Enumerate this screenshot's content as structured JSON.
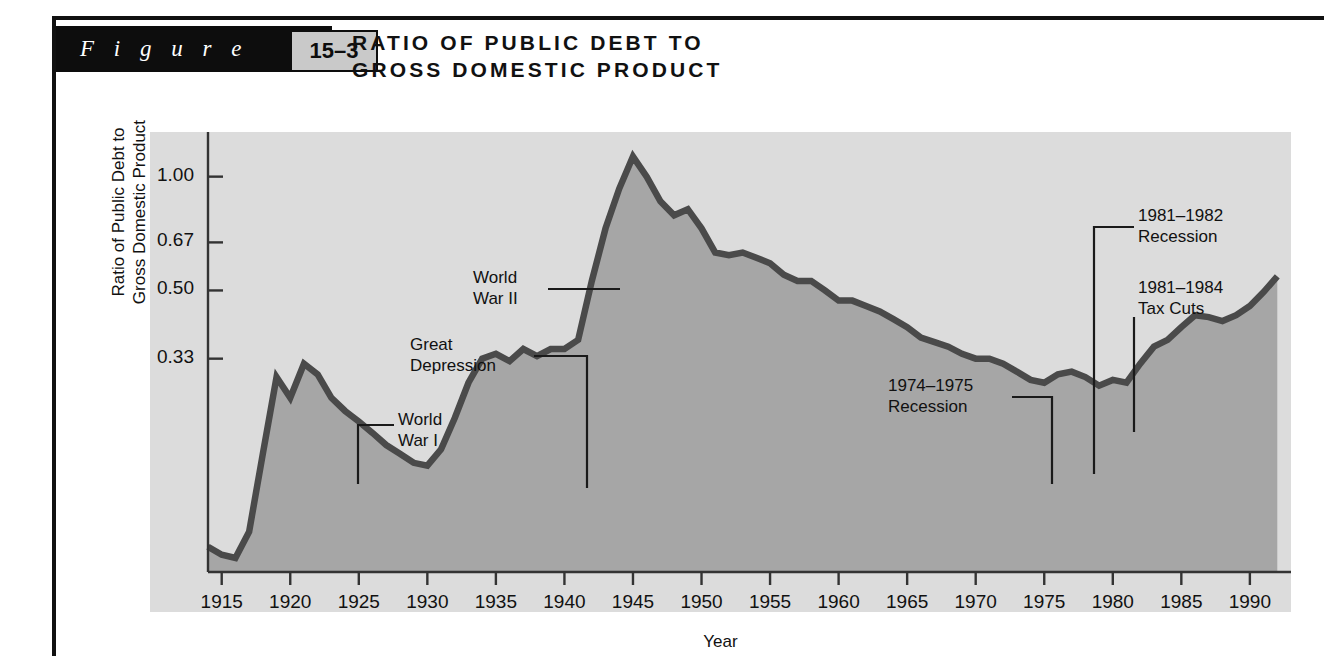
{
  "figure": {
    "label": "F i g u r e",
    "number": "15–3"
  },
  "headline": {
    "line1": "RATIO OF PUBLIC DEBT TO",
    "line2": "GROSS DOMESTIC PRODUCT",
    "full": "RATIO OF PUBLIC DEBT TO\nGROSS DOMESTIC PRODUCT"
  },
  "colors": {
    "panel_background": "#dcdcdc",
    "area_fill": "#a6a6a6",
    "line": "#4a4a4a",
    "axis": "#333333",
    "text": "#111111",
    "figure_block": "#0d0d0d",
    "figure_number_box": "#c9c9c9"
  },
  "chart_data": {
    "type": "area",
    "title": "RATIO OF PUBLIC DEBT TO GROSS DOMESTIC PRODUCT",
    "xlabel": "Year",
    "ylabel": "Ratio of Public Debt to\nGross Domestic Product",
    "yscale": "log",
    "ylim": [
      0.09,
      1.25
    ],
    "xlim": [
      1914,
      1993
    ],
    "grid": false,
    "legend": null,
    "ytick_labels": [
      "1.00",
      "0.67",
      "0.50",
      "0.33"
    ],
    "ytick_values": [
      1.0,
      0.67,
      0.5,
      0.33
    ],
    "xtick_labels": [
      "1915",
      "1920",
      "1925",
      "1930",
      "1935",
      "1940",
      "1945",
      "1950",
      "1955",
      "1960",
      "1965",
      "1970",
      "1975",
      "1980",
      "1985",
      "1990"
    ],
    "xtick_values": [
      1915,
      1920,
      1925,
      1930,
      1935,
      1940,
      1945,
      1950,
      1955,
      1960,
      1965,
      1970,
      1975,
      1980,
      1985,
      1990
    ],
    "x": [
      1914,
      1915,
      1916,
      1917,
      1918,
      1919,
      1920,
      1921,
      1922,
      1923,
      1924,
      1925,
      1926,
      1927,
      1928,
      1929,
      1930,
      1931,
      1932,
      1933,
      1934,
      1935,
      1936,
      1937,
      1938,
      1939,
      1940,
      1941,
      1942,
      1943,
      1944,
      1945,
      1946,
      1947,
      1948,
      1949,
      1950,
      1951,
      1952,
      1953,
      1954,
      1955,
      1956,
      1957,
      1958,
      1959,
      1960,
      1961,
      1962,
      1963,
      1964,
      1965,
      1966,
      1967,
      1968,
      1969,
      1970,
      1971,
      1972,
      1973,
      1974,
      1975,
      1976,
      1977,
      1978,
      1979,
      1980,
      1981,
      1982,
      1983,
      1984,
      1985,
      1986,
      1987,
      1988,
      1989,
      1990,
      1991,
      1992
    ],
    "y": [
      0.105,
      0.1,
      0.098,
      0.115,
      0.185,
      0.295,
      0.26,
      0.32,
      0.3,
      0.26,
      0.24,
      0.225,
      0.21,
      0.195,
      0.185,
      0.175,
      0.172,
      0.19,
      0.23,
      0.285,
      0.33,
      0.34,
      0.325,
      0.35,
      0.335,
      0.35,
      0.35,
      0.37,
      0.53,
      0.73,
      0.93,
      1.13,
      1.0,
      0.86,
      0.79,
      0.82,
      0.73,
      0.63,
      0.62,
      0.63,
      0.61,
      0.59,
      0.55,
      0.53,
      0.53,
      0.5,
      0.47,
      0.47,
      0.455,
      0.44,
      0.42,
      0.4,
      0.375,
      0.365,
      0.355,
      0.34,
      0.33,
      0.33,
      0.32,
      0.305,
      0.29,
      0.285,
      0.3,
      0.305,
      0.295,
      0.28,
      0.29,
      0.285,
      0.32,
      0.355,
      0.37,
      0.4,
      0.43,
      0.425,
      0.415,
      0.43,
      0.455,
      0.495,
      0.545
    ],
    "annotations": [
      {
        "id": "world-war-i",
        "text": "World\nWar I",
        "year": 1918,
        "value": 0.185
      },
      {
        "id": "great-depression",
        "text": "Great\nDepression",
        "year": 1931,
        "value": 0.19
      },
      {
        "id": "world-war-ii",
        "text": "World\nWar II",
        "year": 1943,
        "value": 0.73
      },
      {
        "id": "recession-1974-1975",
        "text": "1974–1975\nRecession",
        "year": 1975,
        "value": 0.285
      },
      {
        "id": "recession-1981-1982",
        "text": "1981–1982\nRecession",
        "year": 1981,
        "value": 0.285
      },
      {
        "id": "tax-cuts-1981-1984",
        "text": "1981–1984\nTax Cuts",
        "year": 1984,
        "value": 0.37
      }
    ]
  },
  "annotation_labels": {
    "world_war_i": "World\nWar I",
    "great_depression": "Great\nDepression",
    "world_war_ii": "World\nWar II",
    "recession_74_75": "1974–1975\nRecession",
    "recession_81_82": "1981–1982\nRecession",
    "tax_cuts_81_84": "1981–1984\nTax Cuts"
  }
}
